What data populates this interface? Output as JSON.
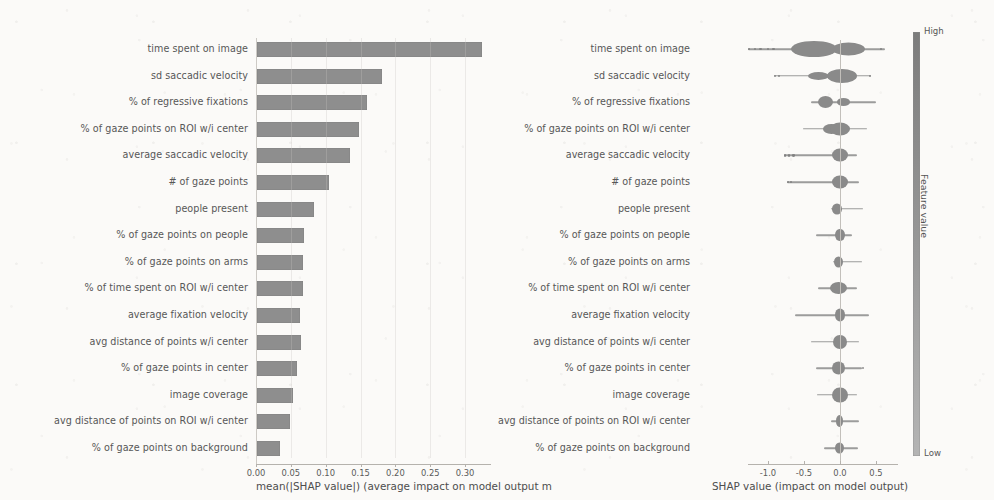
{
  "figure": {
    "kind": "shap-summary-figure",
    "panels": 2,
    "accent_gray": "#8e8e8e",
    "background": "#fbfaf8"
  },
  "colorbar": {
    "title": "Feature value",
    "high_label": "High",
    "low_label": "Low",
    "top_color": "#7c7c7c",
    "bottom_color": "#b4b4b4"
  },
  "chart_data": [
    {
      "type": "bar",
      "orientation": "horizontal",
      "title": "",
      "xlabel": "mean(|SHAP value|) (average impact on model output m",
      "ylabel": "",
      "xlim": [
        0.0,
        0.3375
      ],
      "xticks": [
        "0.00",
        "0.05",
        "0.10",
        "0.15",
        "0.20",
        "0.25",
        "0.30"
      ],
      "xtick_values": [
        0.0,
        0.05,
        0.1,
        0.15,
        0.2,
        0.25,
        0.3
      ],
      "grid": false,
      "bar_color": "#8e8e8e",
      "categories": [
        "time spent on image",
        "sd saccadic velocity",
        "% of regressive fixations",
        "% of gaze points on ROI w/i center",
        "average saccadic velocity",
        "# of gaze points",
        "people present",
        "% of gaze points on people",
        "% of gaze points on arms",
        "% of time spent on ROI w/i center",
        "average fixation velocity",
        "avg distance of points w/i center",
        "% of gaze points in center",
        "image coverage",
        "avg distance of points on ROI w/i center",
        "% of gaze points on background"
      ],
      "values": [
        0.323,
        0.179,
        0.158,
        0.146,
        0.134,
        0.103,
        0.082,
        0.068,
        0.066,
        0.066,
        0.062,
        0.063,
        0.057,
        0.052,
        0.048,
        0.033
      ]
    },
    {
      "type": "scatter",
      "subtype": "beeswarm",
      "title": "",
      "xlabel": "SHAP value (impact on model output)",
      "ylabel": "",
      "xlim": [
        -1.35,
        0.85
      ],
      "xticks": [
        "-1.0",
        "-0.5",
        "0.0",
        "0.5"
      ],
      "xtick_values": [
        -1.0,
        -0.5,
        0.0,
        0.5
      ],
      "grid": false,
      "zero_reference_line": 0.0,
      "point_color": "#8a8a8a",
      "categories": [
        "time spent on image",
        "sd saccadic velocity",
        "% of regressive fixations",
        "% of gaze points on ROI w/i center",
        "average saccadic velocity",
        "# of gaze points",
        "people present",
        "% of gaze points on people",
        "% of gaze points on arms",
        "% of time spent on ROI w/i center",
        "average fixation velocity",
        "avg distance of points w/i center",
        "% of gaze points in center",
        "image coverage",
        "avg distance of points on ROI w/i center",
        "% of gaze points on background"
      ],
      "rows": [
        {
          "feature": "time spent on image",
          "whisker_min": -1.28,
          "whisker_max": 0.62,
          "blobs": [
            {
              "c": -0.36,
              "w": 0.3,
              "h": 16
            },
            {
              "c": 0.12,
              "w": 0.22,
              "h": 13
            }
          ],
          "outliers": [
            -1.28,
            -1.2,
            -1.12,
            -1.02,
            -0.94,
            0.55
          ]
        },
        {
          "feature": "sd saccadic velocity",
          "whisker_min": -0.92,
          "whisker_max": 0.43,
          "blobs": [
            {
              "c": -0.3,
              "w": 0.14,
              "h": 8
            },
            {
              "c": 0.03,
              "w": 0.2,
              "h": 14
            }
          ],
          "outliers": [
            -0.92,
            -0.86,
            0.4
          ]
        },
        {
          "feature": "% of regressive fixations",
          "whisker_min": -0.4,
          "whisker_max": 0.5,
          "blobs": [
            {
              "c": -0.2,
              "w": 0.1,
              "h": 12
            },
            {
              "c": 0.05,
              "w": 0.09,
              "h": 8
            }
          ],
          "outliers": []
        },
        {
          "feature": "% of gaze points on ROI w/i center",
          "whisker_min": -0.52,
          "whisker_max": 0.38,
          "blobs": [
            {
              "c": -0.12,
              "w": 0.11,
              "h": 10
            },
            {
              "c": 0.0,
              "w": 0.13,
              "h": 13
            }
          ],
          "outliers": []
        },
        {
          "feature": "average saccadic velocity",
          "whisker_min": -0.78,
          "whisker_max": 0.24,
          "blobs": [
            {
              "c": 0.0,
              "w": 0.1,
              "h": 13
            }
          ],
          "outliers": [
            -0.78,
            -0.72,
            -0.66
          ]
        },
        {
          "feature": "# of gaze points",
          "whisker_min": -0.74,
          "whisker_max": 0.27,
          "blobs": [
            {
              "c": 0.0,
              "w": 0.1,
              "h": 13
            }
          ],
          "outliers": [
            -0.74,
            -0.7
          ]
        },
        {
          "feature": "people present",
          "whisker_min": -0.12,
          "whisker_max": 0.32,
          "blobs": [
            {
              "c": -0.04,
              "w": 0.07,
              "h": 11
            }
          ],
          "outliers": []
        },
        {
          "feature": "% of gaze points on people",
          "whisker_min": -0.34,
          "whisker_max": 0.17,
          "blobs": [
            {
              "c": 0.0,
              "w": 0.06,
              "h": 12
            }
          ],
          "outliers": []
        },
        {
          "feature": "% of gaze points on arms",
          "whisker_min": -0.1,
          "whisker_max": 0.31,
          "blobs": [
            {
              "c": -0.02,
              "w": 0.06,
              "h": 11
            }
          ],
          "outliers": []
        },
        {
          "feature": "% of time spent on ROI w/i center",
          "whisker_min": -0.3,
          "whisker_max": 0.24,
          "blobs": [
            {
              "c": -0.02,
              "w": 0.11,
              "h": 12
            }
          ],
          "outliers": []
        },
        {
          "feature": "average fixation velocity",
          "whisker_min": -0.62,
          "whisker_max": 0.4,
          "blobs": [
            {
              "c": 0.0,
              "w": 0.07,
              "h": 13
            }
          ],
          "outliers": []
        },
        {
          "feature": "avg distance of points w/i center",
          "whisker_min": -0.4,
          "whisker_max": 0.26,
          "blobs": [
            {
              "c": 0.0,
              "w": 0.09,
              "h": 14
            }
          ],
          "outliers": []
        },
        {
          "feature": "% of gaze points in center",
          "whisker_min": -0.33,
          "whisker_max": 0.3,
          "blobs": [
            {
              "c": -0.02,
              "w": 0.09,
              "h": 13
            }
          ],
          "outliers": [
            0.3
          ]
        },
        {
          "feature": "image coverage",
          "whisker_min": -0.32,
          "whisker_max": 0.24,
          "blobs": [
            {
              "c": 0.0,
              "w": 0.1,
              "h": 15
            }
          ],
          "outliers": []
        },
        {
          "feature": "avg distance of points on ROI w/i center",
          "whisker_min": -0.12,
          "whisker_max": 0.26,
          "blobs": [
            {
              "c": -0.01,
              "w": 0.05,
              "h": 12
            }
          ],
          "outliers": []
        },
        {
          "feature": "% of gaze points on background",
          "whisker_min": -0.22,
          "whisker_max": 0.25,
          "blobs": [
            {
              "c": -0.01,
              "w": 0.06,
              "h": 11
            }
          ],
          "outliers": []
        }
      ]
    }
  ]
}
